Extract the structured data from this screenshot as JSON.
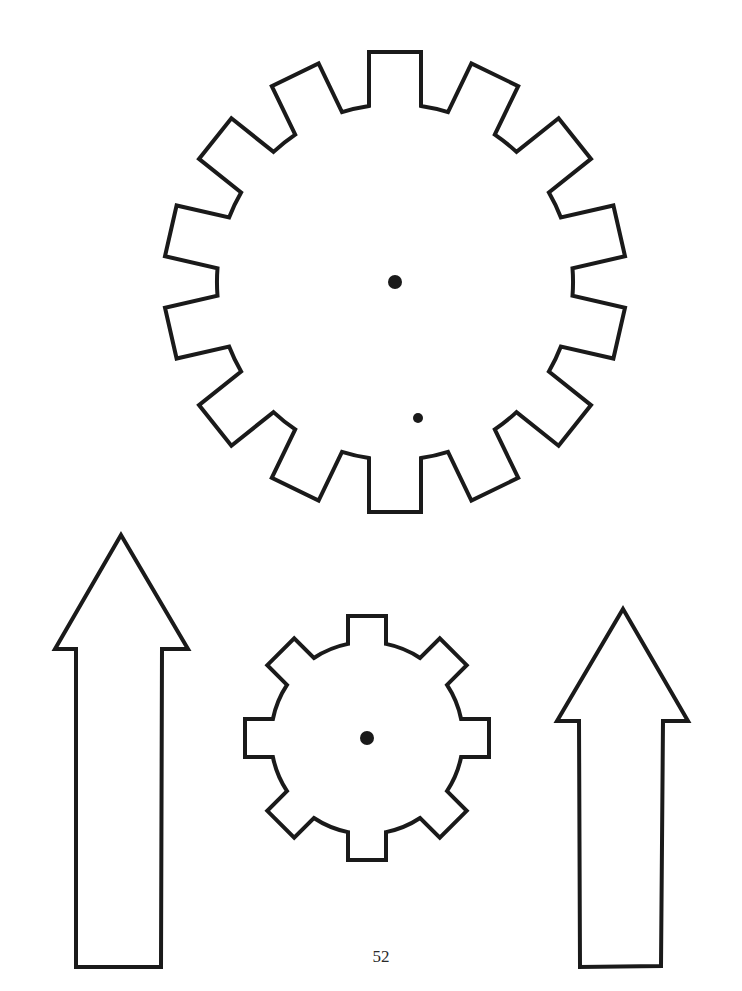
{
  "page": {
    "number": "52",
    "background_color": "#ffffff",
    "stroke_color": "#1a1a1a"
  },
  "shapes": {
    "large_gear": {
      "teeth": 14,
      "center": [
        395,
        282
      ],
      "holes": [
        {
          "x": 395,
          "y": 282,
          "r": 7
        },
        {
          "x": 418,
          "y": 418,
          "r": 5
        }
      ]
    },
    "small_gear": {
      "teeth": 8,
      "center": [
        367,
        738
      ],
      "holes": [
        {
          "x": 367,
          "y": 738,
          "r": 7
        }
      ]
    },
    "left_arrow": {
      "direction": "up"
    },
    "right_arrow": {
      "direction": "up"
    }
  }
}
